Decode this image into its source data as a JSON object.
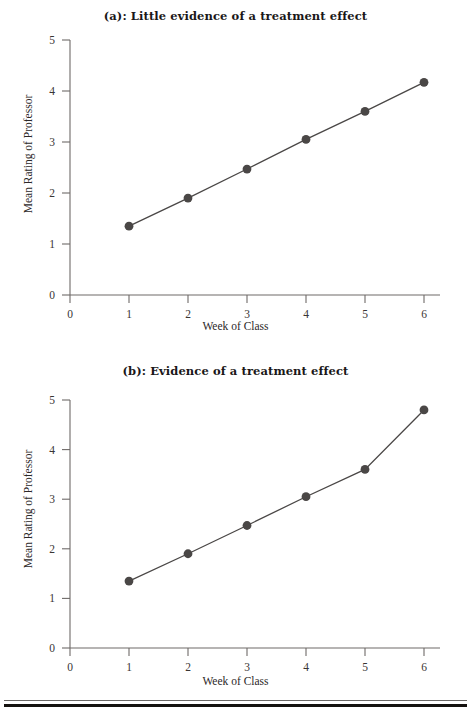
{
  "figure": {
    "background_color": "#ffffff",
    "axis_color": "#6e6a68",
    "series_color": "#4a4746",
    "text_color": "#231f1e"
  },
  "panels": [
    {
      "id": "a",
      "title": "(a): Little evidence of a treatment effect",
      "xlabel": "Week of Class",
      "ylabel": "Mean Rating of Professor",
      "xticks": [
        "0",
        "1",
        "2",
        "3",
        "4",
        "5",
        "6"
      ],
      "yticks": [
        "0",
        "1",
        "2",
        "3",
        "4",
        "5"
      ]
    },
    {
      "id": "b",
      "title": "(b): Evidence of a treatment effect",
      "xlabel": "Week of Class",
      "ylabel": "Mean Rating of Professor",
      "xticks": [
        "0",
        "1",
        "2",
        "3",
        "4",
        "5",
        "6"
      ],
      "yticks": [
        "0",
        "1",
        "2",
        "3",
        "4",
        "5"
      ]
    }
  ],
  "chart_data": [
    {
      "type": "line",
      "title": "(a): Little evidence of a treatment effect",
      "xlabel": "Week of Class",
      "ylabel": "Mean Rating of Professor",
      "x": [
        1,
        2,
        3,
        4,
        5,
        6
      ],
      "values": [
        1.35,
        1.9,
        2.47,
        3.05,
        3.6,
        4.17
      ],
      "categories": [
        "1",
        "2",
        "3",
        "4",
        "5",
        "6"
      ],
      "xlim": [
        0,
        6.2
      ],
      "ylim": [
        0,
        5
      ],
      "xticks": [
        0,
        1,
        2,
        3,
        4,
        5,
        6
      ],
      "yticks": [
        0,
        1,
        2,
        3,
        4,
        5
      ],
      "grid": false,
      "legend": "none",
      "marker": "filled-circle",
      "series_color": "#4a4746"
    },
    {
      "type": "line",
      "title": "(b): Evidence of a treatment effect",
      "xlabel": "Week of Class",
      "ylabel": "Mean Rating of Professor",
      "x": [
        1,
        2,
        3,
        4,
        5,
        6
      ],
      "values": [
        1.35,
        1.9,
        2.47,
        3.05,
        3.6,
        4.8
      ],
      "categories": [
        "1",
        "2",
        "3",
        "4",
        "5",
        "6"
      ],
      "xlim": [
        0,
        6.2
      ],
      "ylim": [
        0,
        5
      ],
      "xticks": [
        0,
        1,
        2,
        3,
        4,
        5,
        6
      ],
      "yticks": [
        0,
        1,
        2,
        3,
        4,
        5
      ],
      "grid": false,
      "legend": "none",
      "marker": "filled-circle",
      "series_color": "#4a4746"
    }
  ]
}
